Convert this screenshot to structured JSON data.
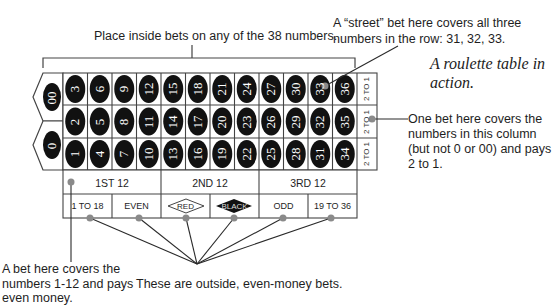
{
  "annotations": {
    "inside_bets": "Place inside bets on any of the 38 numbers.",
    "street_bet_line1": "A “street” bet here covers all three",
    "street_bet_line2": "numbers in the row: 31, 32, 33.",
    "title_line1": "A roulette table in",
    "title_line2": "action.",
    "column_bet_line1": "One bet here covers the",
    "column_bet_line2": "numbers in this column",
    "column_bet_line3": "(but not 0 or 00) and pays",
    "column_bet_line4": "2 to 1.",
    "dozen_bet_line1": "A bet here covers the",
    "dozen_bet_line2": "numbers 1-12 and pays",
    "dozen_bet_line3": "even money.",
    "outside_bets": "These are outside, even-money bets."
  },
  "table": {
    "zeros": [
      "00",
      "0"
    ],
    "rows": [
      [
        "3",
        "6",
        "9",
        "12",
        "15",
        "18",
        "21",
        "24",
        "27",
        "30",
        "33",
        "36"
      ],
      [
        "2",
        "5",
        "8",
        "11",
        "14",
        "17",
        "20",
        "23",
        "26",
        "29",
        "32",
        "35"
      ],
      [
        "1",
        "4",
        "7",
        "10",
        "13",
        "16",
        "19",
        "22",
        "25",
        "28",
        "31",
        "34"
      ]
    ],
    "column_bets": [
      "2 TO 1",
      "2 TO 1",
      "2 TO 1"
    ],
    "dozens": [
      "1ST 12",
      "2ND 12",
      "3RD 12"
    ],
    "even_money": [
      "1 TO 18",
      "EVEN",
      "RED",
      "BLACK",
      "ODD",
      "19 TO 36"
    ]
  },
  "colors": {
    "number_oval": "#111111",
    "grid_line": "#444444",
    "marker_dot": "#8a8a8a",
    "leader_line": "#2a2a2a"
  }
}
